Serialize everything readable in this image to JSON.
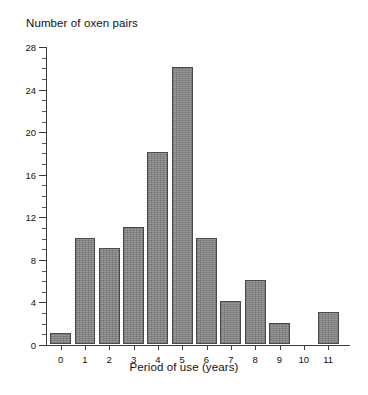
{
  "chart_data": {
    "type": "bar",
    "title": "",
    "ylabel": "Number of oxen pairs",
    "xlabel": "Period of use (years)",
    "categories": [
      "0",
      "1",
      "2",
      "3",
      "4",
      "5",
      "6",
      "7",
      "8",
      "9",
      "10",
      "11"
    ],
    "values": [
      1,
      10,
      9,
      11,
      18,
      26,
      10,
      4,
      6,
      2,
      0,
      3
    ],
    "ylim": [
      0,
      28
    ],
    "xlim": [
      -0.6,
      11.9
    ],
    "y_major_ticks": [
      0,
      4,
      8,
      12,
      16,
      20,
      24,
      28
    ],
    "y_minor_tick_step": 1,
    "y_tick_labels": [
      "0",
      "4",
      "8",
      "12",
      "16",
      "20",
      "24",
      "28"
    ],
    "grid": false,
    "legend": null,
    "bar_color": "#8a8a8a",
    "bar_edge_color": "#4a4a4a",
    "axis_color": "#3b3b3b",
    "background": "#ffffff"
  }
}
